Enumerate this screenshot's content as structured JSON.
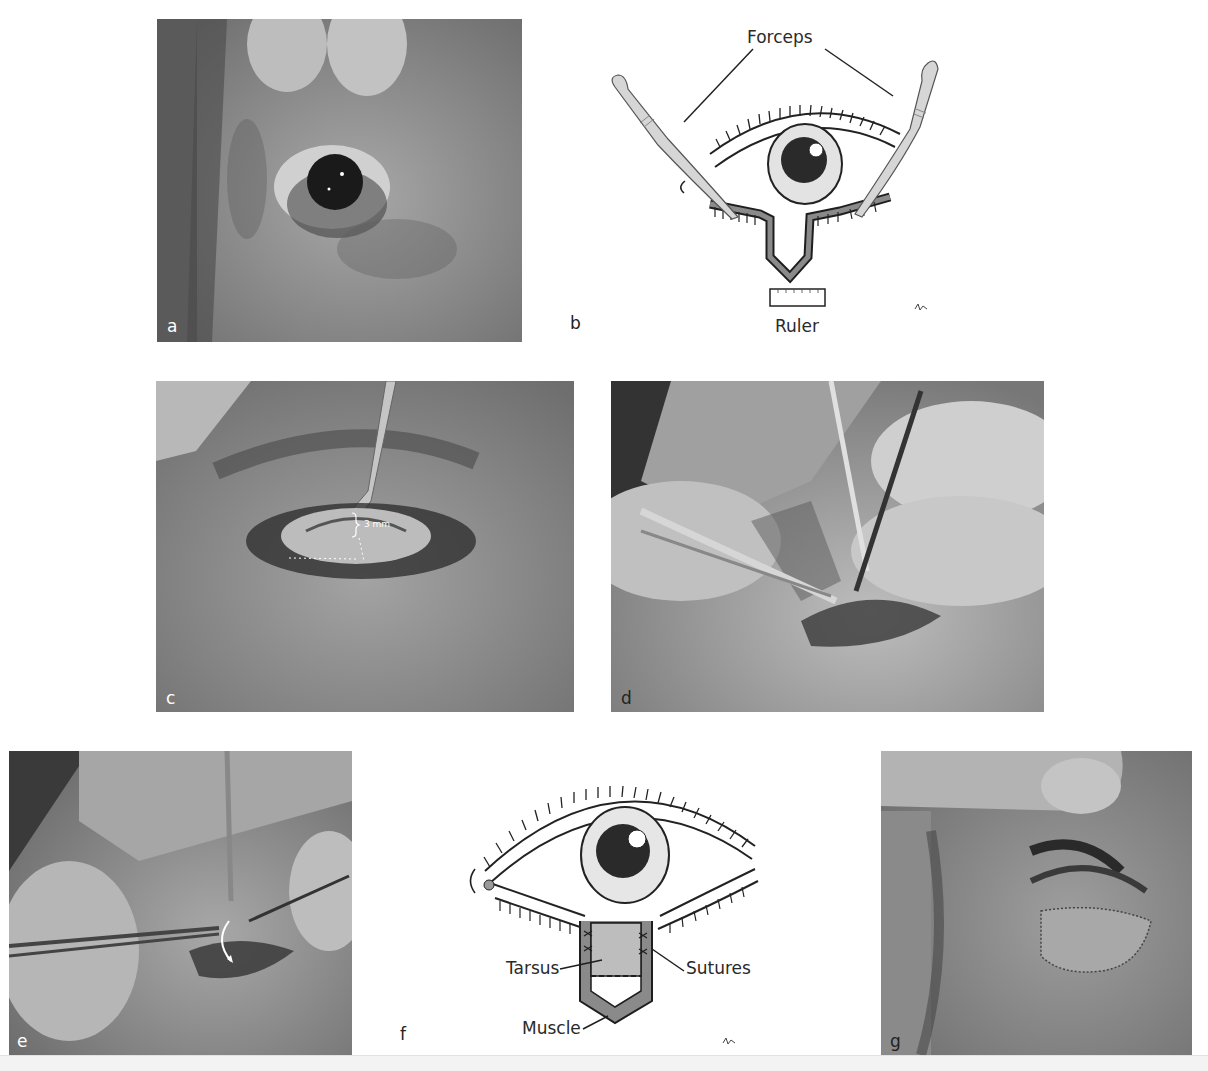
{
  "figure": {
    "panels": [
      {
        "id": "a",
        "type": "photo",
        "label": "a",
        "description": "Preoperative eye with lower eyelid retraction, upper lid lifted by fingers"
      },
      {
        "id": "b",
        "type": "diagram",
        "label": "b",
        "annotations": [
          "Forceps",
          "Ruler"
        ]
      },
      {
        "id": "c",
        "type": "photo",
        "label": "c",
        "annotations": [
          "3 mm"
        ],
        "description": "Tarsal strip marked 3 mm with retractor"
      },
      {
        "id": "d",
        "type": "photo",
        "label": "d",
        "description": "Dissection with scissors and forceps"
      },
      {
        "id": "e",
        "type": "photo",
        "label": "e",
        "description": "Tarsal graft rotated into position (curved arrow)"
      },
      {
        "id": "f",
        "type": "diagram",
        "label": "f",
        "annotations": [
          "Tarsus",
          "Sutures",
          "Muscle"
        ]
      },
      {
        "id": "g",
        "type": "photo",
        "label": "g",
        "description": "Postoperative result with sutured graft"
      }
    ],
    "labels": {
      "a": "a",
      "b": "b",
      "c": "c",
      "d": "d",
      "e": "e",
      "f": "f",
      "g": "g"
    },
    "diagram_b": {
      "forceps": "Forceps",
      "ruler": "Ruler"
    },
    "photo_c": {
      "measure": "3 mm"
    },
    "diagram_f": {
      "tarsus": "Tarsus",
      "sutures": "Sutures",
      "muscle": "Muscle"
    },
    "colors": {
      "photo_gray": "#7a7a7a",
      "diagram_fill": "#d8d8d8",
      "muscle_fill": "#8a8a8a",
      "tarsus_fill": "#bdbdbd",
      "line": "#1e1e1e"
    }
  }
}
